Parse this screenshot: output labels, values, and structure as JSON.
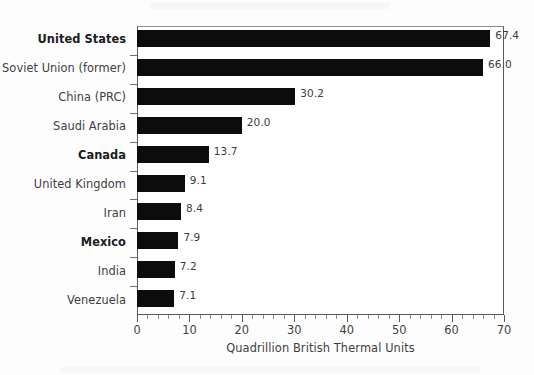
{
  "chart_data": {
    "type": "bar",
    "orientation": "horizontal",
    "title": "",
    "subtitle": "",
    "xlabel": "Quadrillion British Thermal Units",
    "ylabel": "",
    "xlim": [
      0,
      70
    ],
    "xticks": [
      0,
      10,
      20,
      30,
      40,
      50,
      60,
      70
    ],
    "xtick_labels": [
      "0",
      "10",
      "20",
      "30",
      "40",
      "50",
      "60",
      "70"
    ],
    "minor_tick_interval": 2,
    "grid": false,
    "legend": false,
    "bar_color": "#0c0c0c",
    "categories": [
      "United States",
      "Soviet Union (former)",
      "China (PRC)",
      "Saudi Arabia",
      "Canada",
      "United Kingdom",
      "Iran",
      "Mexico",
      "India",
      "Venezuela"
    ],
    "values": [
      67.4,
      66.0,
      30.2,
      20.0,
      13.7,
      9.1,
      8.4,
      7.9,
      7.2,
      7.1
    ],
    "value_labels": [
      "67.4",
      "66.0",
      "30.2",
      "20.0",
      "13.7",
      "9.1",
      "8.4",
      "7.9",
      "7.2",
      "7.1"
    ],
    "emphasized_categories": [
      "United States",
      "Canada",
      "Mexico"
    ]
  }
}
